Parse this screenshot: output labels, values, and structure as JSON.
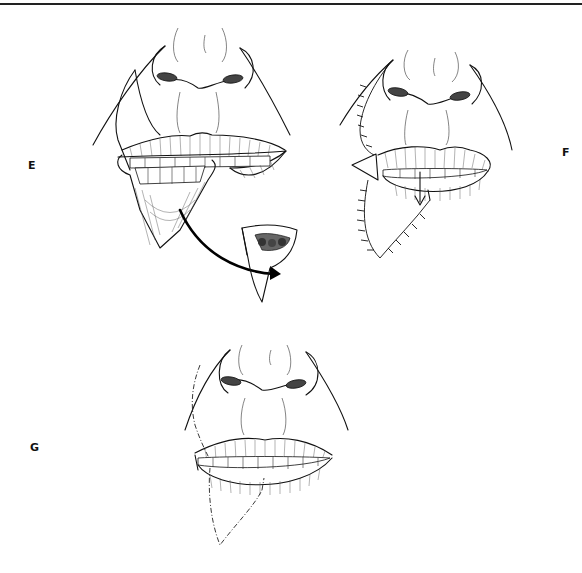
{
  "figure": {
    "panels": [
      {
        "id": "E",
        "label": "E",
        "description": "Wedge excision of lower lip lesion with excised specimen shown"
      },
      {
        "id": "F",
        "label": "F",
        "description": "Lip flap advanced and sutured"
      },
      {
        "id": "G",
        "label": "G",
        "description": "Healed result with dashed scar lines"
      }
    ]
  },
  "colors": {
    "ink": "#111111",
    "background": "#ffffff",
    "rule": "#222222"
  }
}
